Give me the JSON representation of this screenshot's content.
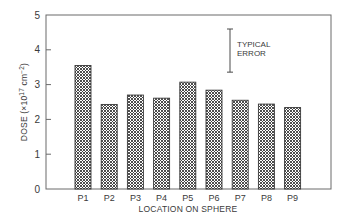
{
  "chart_data": {
    "type": "bar",
    "title": "",
    "xlabel": "LOCATION ON SPHERE",
    "ylabel": "DOSE (×10¹⁷ cm⁻²)",
    "ylabel_parts": {
      "main": "DOSE (×10",
      "exp1": "17",
      "mid": " cm",
      "exp2": "−2",
      "end": ")"
    },
    "categories": [
      "P1",
      "P2",
      "P3",
      "P4",
      "P5",
      "P6",
      "P7",
      "P8",
      "P9"
    ],
    "values": [
      3.55,
      2.43,
      2.7,
      2.61,
      3.07,
      2.84,
      2.55,
      2.44,
      2.34
    ],
    "ylim": [
      0,
      5
    ],
    "yticks": [
      0,
      1,
      2,
      3,
      4,
      5
    ],
    "grid": false,
    "legend": null,
    "bar_fill": "crosshatch",
    "annotation": {
      "label_line1": "TYPICAL",
      "label_line2": "ERROR",
      "error_bar_span": 1.24
    }
  },
  "colors": {
    "ink": "#3a3a3a",
    "background": "#ffffff"
  }
}
